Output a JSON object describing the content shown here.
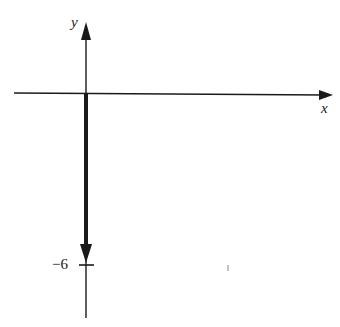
{
  "diagram": {
    "x_axis_label": "x",
    "y_axis_label": "y",
    "tick_label": "−6",
    "vector": {
      "from": [
        0,
        0
      ],
      "to": [
        0,
        -6
      ],
      "direction": "down"
    },
    "colors": {
      "ink": "#1a1a1a",
      "background": "#ffffff"
    }
  }
}
